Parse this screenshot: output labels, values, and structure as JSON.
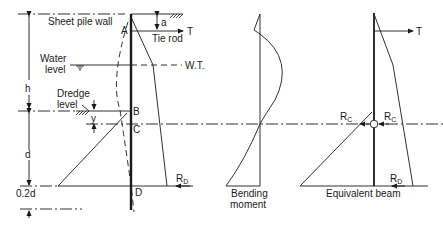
{
  "diagram": {
    "left_panel": {
      "labels": {
        "sheet_pile_wall": "Sheet pile wall",
        "tie_rod": "Tie rod",
        "tie_force": "T",
        "dim_a": "a",
        "dim_h": "h",
        "water_level_1": "Water",
        "water_level_2": "level",
        "wt": "W.T.",
        "dredge_level_1": "Dredge",
        "dredge_level_2": "level",
        "dim_y": "y",
        "dim_d": "d",
        "dim_02d": "0.2d",
        "point_a": "A",
        "point_b": "B",
        "point_c": "C",
        "point_d": "D",
        "reaction_d": "R",
        "reaction_d_sub": "D"
      }
    },
    "middle_panel": {
      "caption_1": "Bending",
      "caption_2": "moment"
    },
    "right_panel": {
      "caption": "Equivalent beam",
      "tie_force": "T",
      "reaction_c_left": "R",
      "reaction_c_left_sub": "C",
      "reaction_c_right": "R",
      "reaction_c_right_sub": "C",
      "reaction_d": "R",
      "reaction_d_sub": "D"
    }
  }
}
